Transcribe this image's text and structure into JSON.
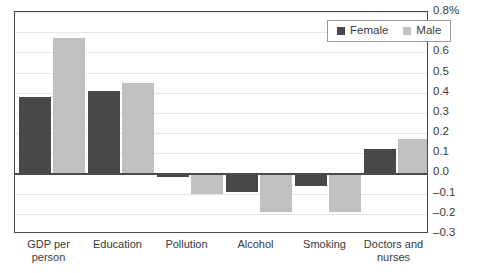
{
  "chart_data": {
    "type": "bar",
    "title": "",
    "xlabel": "",
    "ylabel": "",
    "categories": [
      "GDP per person",
      "Education",
      "Pollution",
      "Alcohol",
      "Smoking",
      "Doctors and nurses"
    ],
    "series": [
      {
        "name": "Female",
        "color": "#484848",
        "values": [
          0.38,
          0.41,
          -0.02,
          -0.09,
          -0.06,
          0.12
        ]
      },
      {
        "name": "Male",
        "color": "#c0c0c0",
        "values": [
          0.67,
          0.45,
          -0.1,
          -0.19,
          -0.19,
          0.17
        ]
      }
    ],
    "ylim": [
      -0.3,
      0.8
    ],
    "y_ticks": [
      0.8,
      0.7,
      0.6,
      0.5,
      0.4,
      0.3,
      0.2,
      0.1,
      0.0,
      -0.1,
      -0.2,
      -0.3
    ],
    "y_tick_labels": [
      "0.8%",
      "0.7",
      "0.6",
      "0.5",
      "0.4",
      "0.3",
      "0.2",
      "0.1",
      "0.0",
      "–0.1",
      "–0.2",
      "–0.3"
    ],
    "grid": true,
    "legend_position": "top-right",
    "legend_entries": [
      "Female",
      "Male"
    ],
    "axis_side": "right",
    "zero_line": true
  },
  "legend": {
    "female_label": "Female",
    "male_label": "Male"
  },
  "colors": {
    "female_bar": "#484848",
    "male_bar": "#c0c0c0",
    "gridline": "#e6e6e6",
    "axis": "#4a4a4a",
    "text": "#3a3a3a",
    "background": "#ffffff"
  }
}
